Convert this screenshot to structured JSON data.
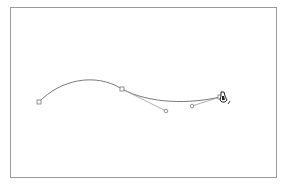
{
  "canvas": {
    "frame": {
      "x": 10,
      "y": 7,
      "width": 267,
      "height": 171,
      "border_color": "#9a9a9a"
    },
    "background": "#ffffff"
  },
  "path": {
    "stroke_color": "#7a7a7a",
    "stroke_width": 1,
    "d": "M39,102 C60,80 95,72 122,89 C150,104 190,104 220,97",
    "anchors": [
      {
        "x": 39,
        "y": 102
      },
      {
        "x": 122,
        "y": 89
      },
      {
        "x": 220,
        "y": 97
      }
    ],
    "handles": [
      {
        "from": {
          "x": 122,
          "y": 89
        },
        "to": {
          "x": 166,
          "y": 111
        }
      },
      {
        "from": {
          "x": 220,
          "y": 97
        },
        "to": {
          "x": 192,
          "y": 106
        }
      }
    ]
  },
  "cursor": {
    "type": "pen-tool-cursor",
    "x": 220,
    "y": 95,
    "color": "#222222"
  }
}
